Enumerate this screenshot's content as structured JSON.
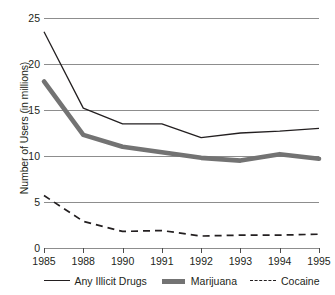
{
  "chart_data": {
    "type": "line",
    "title": "",
    "xlabel": "",
    "ylabel": "Number of Users (in millions)",
    "categories": [
      "1985",
      "1988",
      "1990",
      "1991",
      "1992",
      "1993",
      "1994",
      "1995"
    ],
    "x": [
      1985,
      1988,
      1990,
      1991,
      1992,
      1993,
      1994,
      1995
    ],
    "ylim": [
      0,
      25
    ],
    "yticks": [
      0,
      5,
      10,
      15,
      20,
      25
    ],
    "grid": true,
    "legend_position": "bottom",
    "series": [
      {
        "name": "Any Illicit Drugs",
        "style": "solid-thin",
        "color": "#231f20",
        "values": [
          23.5,
          15.2,
          13.5,
          13.5,
          12.0,
          12.5,
          12.7,
          13.0
        ]
      },
      {
        "name": "Marijuana",
        "style": "solid-thick",
        "color": "#737373",
        "values": [
          18.1,
          12.3,
          11.0,
          10.4,
          9.8,
          9.5,
          10.2,
          9.7
        ]
      },
      {
        "name": "Cocaine",
        "style": "dashed",
        "color": "#231f20",
        "values": [
          5.7,
          2.9,
          1.8,
          1.9,
          1.3,
          1.4,
          1.4,
          1.5
        ]
      }
    ]
  },
  "axes": {
    "y_title": "Number of Users (in millions)",
    "y_tick_labels": [
      "25",
      "20",
      "15",
      "10",
      "5",
      "0"
    ],
    "x_tick_labels": [
      "1985",
      "1988",
      "1990",
      "1991",
      "1992",
      "1993",
      "1994",
      "1995"
    ]
  },
  "legend": {
    "items": [
      {
        "label": "Any Illicit Drugs",
        "swatch": "solid-thin-line-icon"
      },
      {
        "label": "Marijuana",
        "swatch": "solid-thick-line-icon"
      },
      {
        "label": "Cocaine",
        "swatch": "dashed-line-icon"
      }
    ]
  },
  "colors": {
    "series_primary": "#231f20",
    "series_secondary": "#737373",
    "gridline": "#8d8d8d",
    "background": "#ffffff"
  }
}
